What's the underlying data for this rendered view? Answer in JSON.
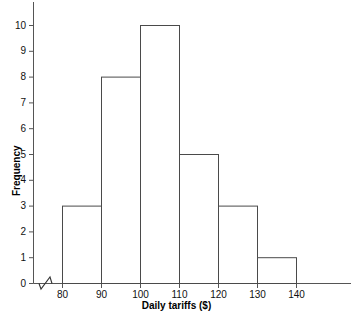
{
  "chart_data": {
    "type": "bar",
    "title": "",
    "subtitle": "",
    "xlabel": "Daily tariffs ($)",
    "ylabel": "Frequency",
    "categories": [
      "80-90",
      "90-100",
      "100-110",
      "110-120",
      "120-130",
      "130-140"
    ],
    "bin_edges": [
      80,
      90,
      100,
      110,
      120,
      130,
      140
    ],
    "values": [
      3,
      8,
      10,
      5,
      3,
      1
    ],
    "x_tick_labels": [
      "80",
      "90",
      "100",
      "110",
      "120",
      "130",
      "140"
    ],
    "x_tick_values": [
      80,
      90,
      100,
      110,
      120,
      130,
      140
    ],
    "y_tick_labels": [
      "0",
      "1",
      "2",
      "3",
      "4",
      "5",
      "6",
      "7",
      "8",
      "9",
      "10"
    ],
    "y_tick_values": [
      0,
      1,
      2,
      3,
      4,
      5,
      6,
      7,
      8,
      9,
      10
    ],
    "xlim": [
      80,
      140
    ],
    "ylim": [
      0,
      10
    ],
    "grid": false,
    "legend": false,
    "legend_position": "none",
    "axis_break": {
      "axis": "x",
      "present": true,
      "description": "zigzag break between origin and first tick at 80"
    },
    "bar_fill_color": "#ffffff",
    "bar_edge_color": "#4a4a4a",
    "axis_color": "#555555",
    "background_color": "#ffffff",
    "text_color": "#111111"
  }
}
